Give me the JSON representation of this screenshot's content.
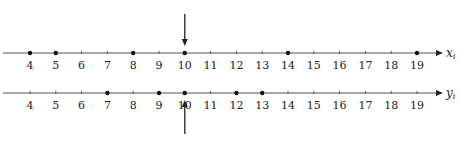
{
  "diagram": {
    "axes": [
      {
        "name": "x",
        "label": "x",
        "subscript": "i",
        "ticks": [
          4,
          5,
          6,
          7,
          8,
          9,
          10,
          11,
          12,
          13,
          14,
          15,
          16,
          17,
          18,
          19
        ],
        "points": [
          4,
          5,
          8,
          10,
          14,
          19
        ],
        "arrow": {
          "at": 10,
          "direction": "down",
          "position": "above"
        }
      },
      {
        "name": "y",
        "label": "y",
        "subscript": "i",
        "ticks": [
          4,
          5,
          6,
          7,
          8,
          9,
          10,
          11,
          12,
          13,
          14,
          15,
          16,
          17,
          18,
          19
        ],
        "points": [
          7,
          9,
          10,
          12,
          13
        ],
        "arrow": {
          "at": 10,
          "direction": "up",
          "position": "below"
        }
      }
    ],
    "colors": {
      "line": "#555555",
      "point": "#111111",
      "text": "#222222"
    }
  }
}
